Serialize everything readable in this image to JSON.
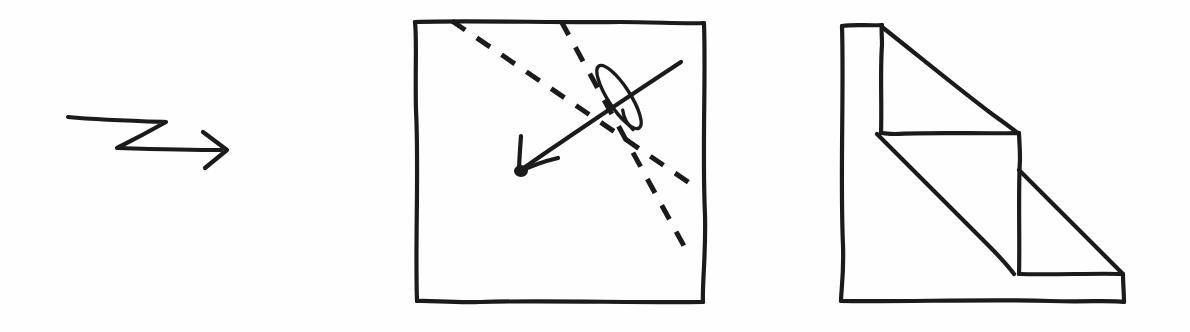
{
  "canvas": {
    "width": 1190,
    "height": 332,
    "background_color": "#fefefe",
    "ink_color": "#1b1b1b",
    "medium": "hand-drawn pen sketch"
  },
  "figures": [
    {
      "id": "zigzag-arrow",
      "name": "zigzag-transform-arrow",
      "role": "transformation arrow between the two drawings",
      "direction": "left-to-right",
      "description": "A hand-drawn arrow whose shaft zigzags: a long stroke to the right, a diagonal back down-left, then a long stroke right ending in an open V arrowhead.",
      "path": "M 68 118 L 166 122 L 117 148 L 222 150",
      "arrowhead": {
        "tip": [
          226,
          150
        ],
        "barb_upper": [
          204,
          133
        ],
        "barb_lower": [
          206,
          167
        ]
      }
    },
    {
      "id": "square-with-section-arrow",
      "name": "square-section-view",
      "role": "plan / top view square annotated with a cutting-plane direction",
      "outline": {
        "shape": "square",
        "corners": [
          [
            415,
            21
          ],
          [
            704,
            24
          ],
          [
            703,
            302
          ],
          [
            417,
            300
          ]
        ]
      },
      "dashed_lines": [
        {
          "name": "dashed-fold-line-upper",
          "style": "dashed",
          "start": [
            452,
            21
          ],
          "end": [
            694,
            186
          ],
          "dash_pattern": "16 14"
        },
        {
          "name": "dashed-fold-line-lower",
          "style": "dashed",
          "start": [
            561,
            21
          ],
          "end": [
            690,
            257
          ],
          "dash_pattern": "16 14"
        }
      ],
      "direction_arrow": {
        "name": "view-direction-arrow",
        "style": "solid",
        "tail": [
          681,
          62
        ],
        "tip": [
          520,
          170
        ],
        "arrowhead": {
          "tip": [
            518,
            172
          ],
          "barb_upper": [
            519,
            137
          ],
          "barb_lower": [
            556,
            160
          ]
        },
        "note": "points down-left, roughly perpendicular to the dashed lines"
      },
      "loop_annotation": {
        "name": "pen-loop-scribble",
        "description": "A narrow elongated loop drawn over the arrow shaft near its tail, like a cursive flourish.",
        "center": [
          619,
          97
        ],
        "tilt_degrees": -33,
        "length": 74,
        "width": 22
      }
    },
    {
      "id": "stepped-wedge",
      "name": "stepped-wedge-isometric",
      "role": "pictorial / elevation view of a two-step chamfered block",
      "description": "An L-shaped staircase profile with two steps; each step riser has a diagonal line running from its upper-left corner down to the lower-right, indicating a chamfer or cut plane.",
      "outline_path": "M 842 25 L 881 25 L 881 133 L 1019 133 L 1019 274 L 1123 274 L 1124 302 L 841 301 Z",
      "vertices": [
        [
          842,
          25
        ],
        [
          881,
          25
        ],
        [
          881,
          133
        ],
        [
          1019,
          133
        ],
        [
          1019,
          274
        ],
        [
          1123,
          274
        ],
        [
          1124,
          302
        ],
        [
          841,
          301
        ]
      ],
      "interior_lines": [
        {
          "name": "upper-chamfer-diagonal",
          "start": [
            881,
            26
          ],
          "end": [
            1018,
            133
          ]
        },
        {
          "name": "lower-chamfer-diagonal",
          "start": [
            877,
            134
          ],
          "end": [
            1014,
            274
          ]
        },
        {
          "name": "lowest-chamfer-diagonal",
          "start": [
            1019,
            170
          ],
          "end": [
            1122,
            273
          ]
        }
      ],
      "step_count": 2
    }
  ]
}
